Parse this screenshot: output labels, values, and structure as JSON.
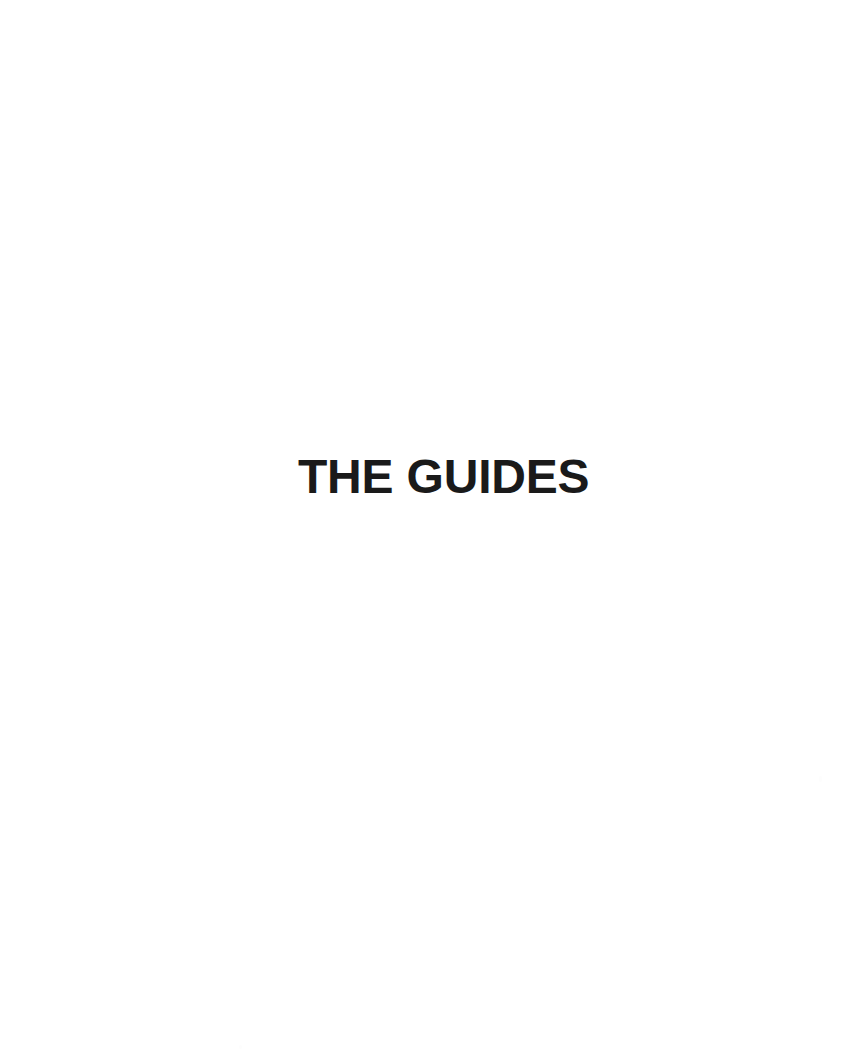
{
  "page": {
    "width": 849,
    "height": 1053,
    "background_color": "#ffffff",
    "kind": "section-divider-page"
  },
  "content": {
    "section_title": "THE GUIDES",
    "title_color": "#1a1a1a",
    "title_align": "left",
    "title_case": "uppercase"
  },
  "artifacts": {
    "speck_1": "",
    "speck_2": ""
  }
}
